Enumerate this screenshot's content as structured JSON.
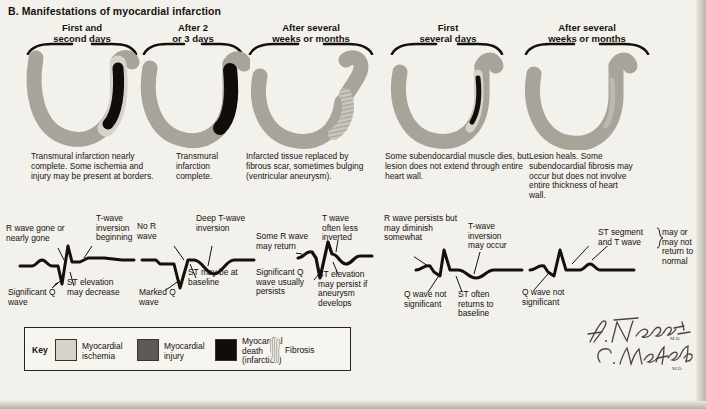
{
  "panel": {
    "title": "B. Manifestations of myocardial infarction"
  },
  "columns": [
    {
      "id": "col-1",
      "head_line1": "First and",
      "head_line2": "second days"
    },
    {
      "id": "col-2",
      "head_line1": "After 2",
      "head_line2": "or 3 days"
    },
    {
      "id": "col-3",
      "head_line1": "After several",
      "head_line2": "weeks or months"
    },
    {
      "id": "col-4",
      "head_line1": "First",
      "head_line2": "several days"
    },
    {
      "id": "col-5",
      "head_line1": "After several",
      "head_line2": "weeks or months"
    }
  ],
  "descriptions": [
    {
      "id": "desc-1",
      "text": "Transmural infarction nearly complete. Some ischemia and injury may be present at borders."
    },
    {
      "id": "desc-2",
      "text": "Transmural infarction complete."
    },
    {
      "id": "desc-3",
      "text": "Infarcted tissue replaced by fibrous scar, sometimes bulging (ventricular aneurysm)."
    },
    {
      "id": "desc-4",
      "text": "Some subendocardial muscle dies, but lesion does not extend through entire heart wall."
    },
    {
      "id": "desc-5",
      "text": "Lesion heals. Some subendocardial fibrosis may occur but does not involve entire thickness of heart wall."
    }
  ],
  "annotations": {
    "col1": [
      {
        "id": "ann-r-wave-gone",
        "text": "R wave gone or nearly gone"
      },
      {
        "id": "ann-t-wave-inv-begin",
        "text": "T-wave inversion beginning"
      },
      {
        "id": "ann-significant-q-wave",
        "text": "Significant Q wave"
      },
      {
        "id": "ann-st-elev-decrease",
        "text": "ST elevation may decrease"
      }
    ],
    "col2": [
      {
        "id": "ann-no-r-wave",
        "text": "No R wave"
      },
      {
        "id": "ann-deep-t-wave-inv",
        "text": "Deep T-wave inversion"
      },
      {
        "id": "ann-marked-q-wave",
        "text": "Marked Q wave"
      },
      {
        "id": "ann-st-at-baseline",
        "text": "ST may be at baseline"
      }
    ],
    "col3": [
      {
        "id": "ann-some-r-return",
        "text": "Some R wave may return"
      },
      {
        "id": "ann-t-wave-less-inv",
        "text": "T wave often less inverted"
      },
      {
        "id": "ann-q-wave-persists",
        "text": "Significant Q wave usually persists"
      },
      {
        "id": "ann-st-persist",
        "text": "ST elevation may persist if aneurysm develops"
      }
    ],
    "col4": [
      {
        "id": "ann-r-wave-persists",
        "text": "R wave persists but may diminish somewhat"
      },
      {
        "id": "ann-t-wave-inv-occur",
        "text": "T-wave inversion may occur"
      },
      {
        "id": "ann-q-not-significant",
        "text": "Q wave not significant"
      },
      {
        "id": "ann-st-returns",
        "text": "ST often returns to baseline"
      }
    ],
    "col5": [
      {
        "id": "ann-st-and-t-wave",
        "text": "ST segment and T wave"
      },
      {
        "id": "ann-may-or-may-not",
        "text": "may or may not return to normal"
      },
      {
        "id": "ann-q-not-significant-5",
        "text": "Q wave not significant"
      }
    ]
  },
  "key": {
    "label": "Key",
    "items": [
      {
        "id": "key-ischemia",
        "label": "Myocardial ischemia",
        "color": "#d6d3c9",
        "swatch": "solid"
      },
      {
        "id": "key-injury",
        "label": "Myocardial injury",
        "color": "#5d5a55",
        "swatch": "solid"
      },
      {
        "id": "key-death",
        "label": "Myocardial death (infarction)",
        "color": "#100d0b",
        "swatch": "solid"
      },
      {
        "id": "key-fibrosis",
        "label": "Fibrosis",
        "color": "#b9b5ab",
        "swatch": "hatched"
      }
    ]
  },
  "signature": {
    "line1": "F. Netter",
    "line1_suffix": "M.D.",
    "line2": "C. Machado",
    "line2_suffix": "M.D."
  },
  "palette": {
    "page_background": "#f3f1ec",
    "ischemia": "#d6d3c9",
    "injury": "#5d5a55",
    "death": "#100d0b",
    "fibrosis": "#b9b5ab",
    "muscle": "#a8a49a",
    "ink": "#15100c"
  }
}
